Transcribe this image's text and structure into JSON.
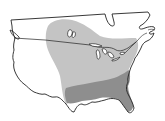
{
  "map": {
    "type": "species-range-map",
    "region": "United States and southern Canada",
    "colors": {
      "background": "#ffffff",
      "land": "#ffffff",
      "outline": "#222222",
      "range_light": "#c4c4c4",
      "range_dark": "#8e8e8e"
    },
    "layers": [
      {
        "id": "range-light",
        "label": "Light gray range area",
        "color": "#c4c4c4"
      },
      {
        "id": "range-dark",
        "label": "Dark gray range area (southeast)",
        "color": "#8e8e8e"
      }
    ]
  }
}
